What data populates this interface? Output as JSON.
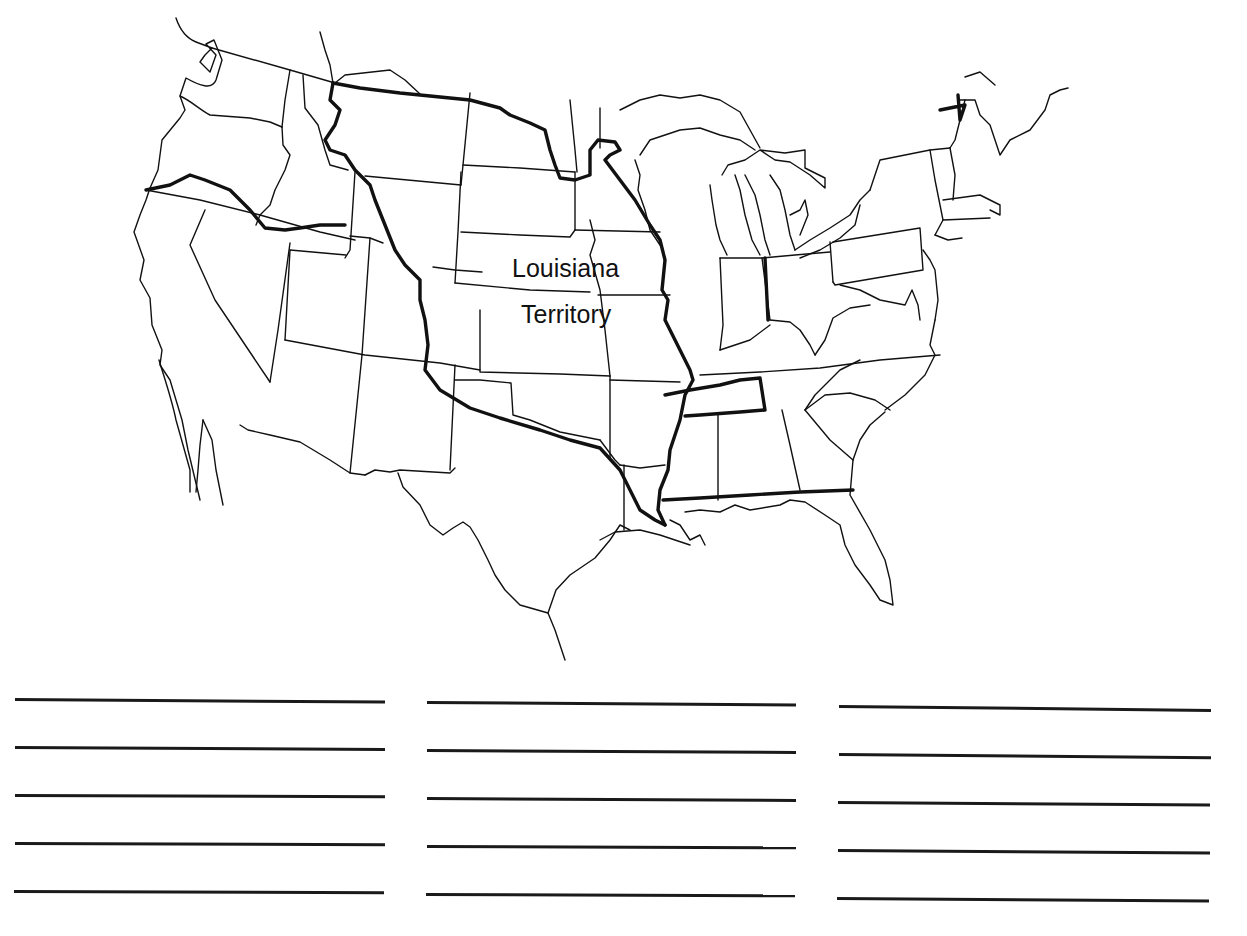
{
  "worksheet": {
    "title_fragment": "",
    "map": {
      "subject": "United States outline map",
      "highlight_region": "Louisiana Territory",
      "label_line1": "Louisiana",
      "label_line2": "Territory",
      "border_color": "#111111"
    },
    "answer_lines": {
      "columns": 3,
      "lines_per_column": 5,
      "values": [
        [
          "",
          "",
          "",
          "",
          ""
        ],
        [
          "",
          "",
          "",
          "",
          ""
        ],
        [
          "",
          "",
          "",
          "",
          ""
        ]
      ]
    }
  }
}
